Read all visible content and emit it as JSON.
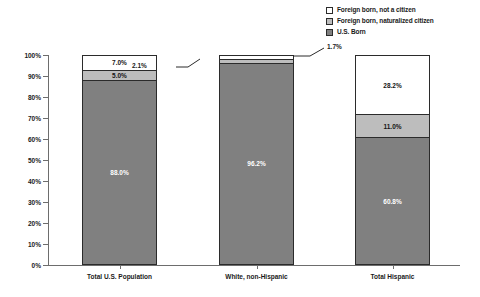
{
  "chart_data": {
    "type": "bar",
    "subtype": "100% stacked column",
    "title": "",
    "xlabel": "",
    "ylabel": "",
    "ylim": [
      0,
      100
    ],
    "ytick_labels": [
      "100%",
      "90%",
      "80%",
      "70%",
      "60%",
      "50%",
      "40%",
      "30%",
      "20%",
      "10%",
      "0%"
    ],
    "ytick_values": [
      100,
      90,
      80,
      70,
      60,
      50,
      40,
      30,
      20,
      10,
      0
    ],
    "grid": false,
    "legend_position": "top-right",
    "categories": [
      "Total U.S. Population",
      "White, non-Hispanic",
      "Total Hispanic"
    ],
    "series": [
      {
        "name": "Foreign born, not a citizen",
        "color": "#ffffff",
        "values": [
          7.0,
          1.7,
          28.2
        ],
        "labels": [
          "7.0%",
          "1.7%",
          "28.2%"
        ]
      },
      {
        "name": "Foreign born, naturalized citizen",
        "color": "#bdbdbd",
        "values": [
          5.0,
          2.1,
          11.0
        ],
        "labels": [
          "5.0%",
          "2.1%",
          "11.0%"
        ]
      },
      {
        "name": "U.S. Born",
        "color": "#808080",
        "values": [
          88.0,
          96.2,
          60.8
        ],
        "labels": [
          "88.0%",
          "96.2%",
          "60.8%"
        ]
      }
    ],
    "annotations": [
      {
        "text": "2.1%",
        "series": "Foreign born, naturalized citizen",
        "category": "White, non-Hispanic",
        "side": "left"
      },
      {
        "text": "1.7%",
        "series": "Foreign born, not a citizen",
        "category": "White, non-Hispanic",
        "side": "right"
      }
    ]
  },
  "legend": {
    "items": [
      {
        "label": "Foreign born, not a citizen",
        "swatch": "sw-white"
      },
      {
        "label": "Foreign born, naturalized citizen",
        "swatch": "sw-light"
      },
      {
        "label": "U.S. Born",
        "swatch": "sw-dark"
      }
    ]
  },
  "axis": {
    "y_labels": [
      "100%",
      "90%",
      "80%",
      "70%",
      "60%",
      "50%",
      "40%",
      "30%",
      "20%",
      "10%",
      "0%"
    ]
  },
  "bars": [
    {
      "category": "Total U.S. Population",
      "segments": [
        {
          "label": "7.0%",
          "pct": 7.0,
          "fill": "seg-white",
          "show_label": true
        },
        {
          "label": "5.0%",
          "pct": 5.0,
          "fill": "seg-light",
          "show_label": true
        },
        {
          "label": "88.0%",
          "pct": 88.0,
          "fill": "seg-dark",
          "show_label": true
        }
      ]
    },
    {
      "category": "White, non-Hispanic",
      "segments": [
        {
          "label": "1.7%",
          "pct": 1.7,
          "fill": "seg-white",
          "show_label": false
        },
        {
          "label": "2.1%",
          "pct": 2.1,
          "fill": "seg-light",
          "show_label": false
        },
        {
          "label": "96.2%",
          "pct": 96.2,
          "fill": "seg-dark",
          "show_label": true
        }
      ]
    },
    {
      "category": "Total Hispanic",
      "segments": [
        {
          "label": "28.2%",
          "pct": 28.2,
          "fill": "seg-white",
          "show_label": true
        },
        {
          "label": "11.0%",
          "pct": 11.0,
          "fill": "seg-light",
          "show_label": true
        },
        {
          "label": "60.8%",
          "pct": 60.8,
          "fill": "seg-dark",
          "show_label": true
        }
      ]
    }
  ],
  "callouts": {
    "left": "2.1%",
    "right": "1.7%"
  }
}
